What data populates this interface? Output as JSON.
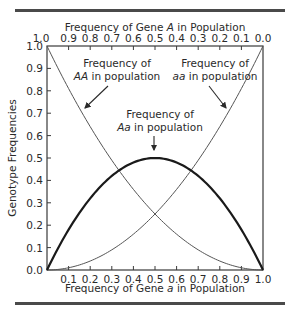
{
  "chart_data": {
    "type": "line",
    "title": "",
    "xlabel": "Frequency of Gene a in Population",
    "x2label": "Frequency of Gene A in Population",
    "ylabel": "Genotype Frequencies",
    "xlim": [
      0,
      1
    ],
    "ylim": [
      0,
      1
    ],
    "grid": false,
    "x_ticks": [
      "0.1",
      "0.2",
      "0.3",
      "0.4",
      "0.5",
      "0.6",
      "0.7",
      "0.8",
      "0.9",
      "1.0"
    ],
    "x2_ticks": [
      "1.0",
      "0.9",
      "0.8",
      "0.7",
      "0.6",
      "0.5",
      "0.4",
      "0.3",
      "0.2",
      "0.1",
      "0.0"
    ],
    "y_ticks": [
      "0.0",
      "0.1",
      "0.2",
      "0.3",
      "0.4",
      "0.5",
      "0.6",
      "0.7",
      "0.8",
      "0.9",
      "1.0"
    ],
    "origin_label": "0.0",
    "x": [
      0,
      0.1,
      0.2,
      0.3,
      0.4,
      0.5,
      0.6,
      0.7,
      0.8,
      0.9,
      1.0
    ],
    "series": [
      {
        "name": "AA",
        "formula": "(1-q)^2",
        "values": [
          1.0,
          0.81,
          0.64,
          0.49,
          0.36,
          0.25,
          0.16,
          0.09,
          0.04,
          0.01,
          0.0
        ],
        "style": "thin"
      },
      {
        "name": "aa",
        "formula": "q^2",
        "values": [
          0.0,
          0.01,
          0.04,
          0.09,
          0.16,
          0.25,
          0.36,
          0.49,
          0.64,
          0.81,
          1.0
        ],
        "style": "thin"
      },
      {
        "name": "Aa",
        "formula": "2q(1-q)",
        "values": [
          0.0,
          0.18,
          0.32,
          0.42,
          0.48,
          0.5,
          0.48,
          0.42,
          0.32,
          0.18,
          0.0
        ],
        "style": "bold"
      }
    ],
    "annotations": [
      {
        "line1": "Frequency of",
        "line2_italic": "AA",
        "line2_rest": " in population"
      },
      {
        "line1": "Frequency of",
        "line2_italic": "aa",
        "line2_rest": " in population"
      },
      {
        "line1": "Frequency of",
        "line2_italic": "Aa",
        "line2_rest": " in population"
      }
    ]
  }
}
